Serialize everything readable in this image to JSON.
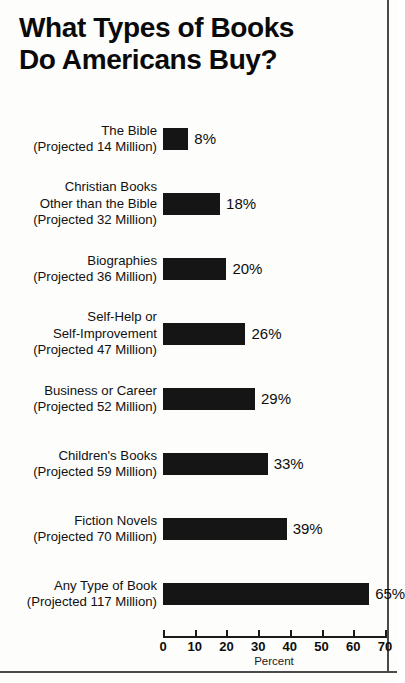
{
  "title": {
    "line1": "What Types of Books",
    "line2": "Do Americans Buy?"
  },
  "chart_data": {
    "type": "bar",
    "orientation": "horizontal",
    "title": "What Types of Books Do Americans Buy?",
    "xlabel": "Percent",
    "ylabel": "",
    "xlim": [
      0,
      70
    ],
    "xticks": [
      0,
      10,
      20,
      30,
      40,
      50,
      60,
      70
    ],
    "xtick_labels": [
      "0",
      "10",
      "20",
      "30",
      "40",
      "50",
      "60",
      "70"
    ],
    "grid": false,
    "legend": false,
    "bar_color": "#151515",
    "categories": [
      "The Bible",
      "Christian Books Other than the Bible",
      "Biographies",
      "Self-Help or Self-Improvement",
      "Business or Career",
      "Children's Books",
      "Fiction Novels",
      "Any Type of Book"
    ],
    "values": [
      8,
      18,
      20,
      26,
      29,
      33,
      39,
      65
    ],
    "value_labels": [
      "8%",
      "18%",
      "20%",
      "26%",
      "29%",
      "33%",
      "39%",
      "65%"
    ],
    "projected_millions": [
      14,
      32,
      36,
      47,
      52,
      59,
      70,
      117
    ]
  },
  "rows": [
    {
      "label_lines": [
        "The Bible",
        "(Projected 14 Million)"
      ],
      "value": 8,
      "value_label": "8%"
    },
    {
      "label_lines": [
        "Christian Books",
        "Other than the Bible",
        "(Projected 32 Million)"
      ],
      "value": 18,
      "value_label": "18%"
    },
    {
      "label_lines": [
        "Biographies",
        "(Projected 36 Million)"
      ],
      "value": 20,
      "value_label": "20%"
    },
    {
      "label_lines": [
        "Self-Help or",
        "Self-Improvement",
        "(Projected 47 Million)"
      ],
      "value": 26,
      "value_label": "26%"
    },
    {
      "label_lines": [
        "Business or Career",
        "(Projected 52 Million)"
      ],
      "value": 29,
      "value_label": "29%"
    },
    {
      "label_lines": [
        "Children's Books",
        "(Projected 59 Million)"
      ],
      "value": 33,
      "value_label": "33%"
    },
    {
      "label_lines": [
        "Fiction Novels",
        "(Projected 70 Million)"
      ],
      "value": 39,
      "value_label": "39%"
    },
    {
      "label_lines": [
        "Any Type of Book",
        "(Projected 117 Million)"
      ],
      "value": 65,
      "value_label": "65%"
    }
  ],
  "axis": {
    "label": "Percent",
    "ticks": [
      "0",
      "10",
      "20",
      "30",
      "40",
      "50",
      "60",
      "70"
    ]
  }
}
